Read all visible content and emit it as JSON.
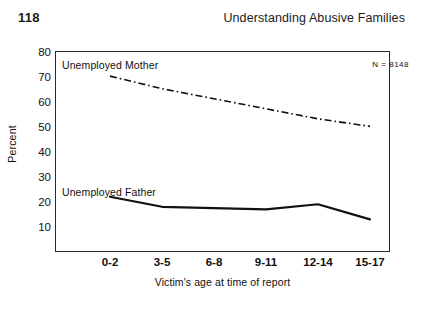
{
  "page": {
    "number": "118",
    "running_head": "Understanding Abusive Families"
  },
  "figure": {
    "n_annotation": "N = 8148",
    "series_labels": {
      "mother": "Unemployed Mother",
      "father": "Unemployed Father"
    }
  },
  "chart_data": {
    "type": "line",
    "title": "",
    "xlabel": "Victim's age at time of report",
    "ylabel": "Percent",
    "categories": [
      "0-2",
      "3-5",
      "6-8",
      "9-11",
      "12-14",
      "15-17"
    ],
    "ylim": [
      0,
      80
    ],
    "yticks": [
      10,
      20,
      30,
      40,
      50,
      60,
      70,
      80
    ],
    "ytick_labels": [
      "10",
      "20",
      "30",
      "40",
      "50",
      "60",
      "70",
      "80"
    ],
    "grid": false,
    "legend": "inline-annotation",
    "annotations": [
      "N = 8148"
    ],
    "series": [
      {
        "name": "Unemployed Mother",
        "style": "dash-dot",
        "color": "#111111",
        "values": [
          70,
          65,
          61,
          57,
          53,
          50
        ]
      },
      {
        "name": "Unemployed Father",
        "style": "solid",
        "color": "#111111",
        "values": [
          22,
          18,
          17.5,
          17,
          19,
          13
        ]
      }
    ]
  }
}
